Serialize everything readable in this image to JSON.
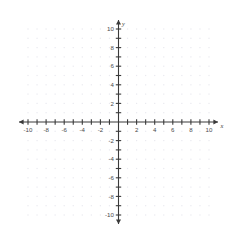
{
  "chart_data": {
    "type": "scatter",
    "title": "",
    "subtitle": "",
    "xlabel": "x",
    "ylabel": "y",
    "xlim": [
      -10,
      10
    ],
    "ylim": [
      -10,
      10
    ],
    "grid": true,
    "grid_style": "dots",
    "grid_step": 1,
    "legend": null,
    "series": [],
    "x": [],
    "values": [],
    "annotations": [],
    "x_tick_step": 1,
    "y_tick_step": 1,
    "x_label_step": 2,
    "y_label_step": 2,
    "zero_label_shown": false,
    "x_tick_labels": [
      "-10",
      "-8",
      "-6",
      "-4",
      "-2",
      "2",
      "4",
      "6",
      "8",
      "10"
    ],
    "x_tick_label_values": [
      -10,
      -8,
      -6,
      -4,
      -2,
      2,
      4,
      6,
      8,
      10
    ],
    "y_tick_labels": [
      "10",
      "8",
      "6",
      "4",
      "2",
      "-2",
      "-4",
      "-6",
      "-8",
      "-10"
    ],
    "y_tick_label_values": [
      10,
      8,
      6,
      4,
      2,
      -2,
      -4,
      -6,
      -8,
      -10
    ],
    "x_minor_tick_values": [
      -10,
      -9,
      -8,
      -7,
      -6,
      -5,
      -4,
      -3,
      -2,
      -1,
      1,
      2,
      3,
      4,
      5,
      6,
      7,
      8,
      9,
      10
    ],
    "y_minor_tick_values": [
      10,
      9,
      8,
      7,
      6,
      5,
      4,
      3,
      2,
      1,
      -1,
      -2,
      -3,
      -4,
      -5,
      -6,
      -7,
      -8,
      -9,
      -10
    ],
    "arrows": [
      "left",
      "right",
      "up",
      "down"
    ]
  },
  "axes": {
    "x_axis_label": "x",
    "y_axis_label": "y"
  },
  "colors": {
    "axis": "#3a3a3a",
    "tick_label": "#4a4a4a",
    "grid_dot": "#e9e9ef",
    "background": "#ffffff"
  }
}
